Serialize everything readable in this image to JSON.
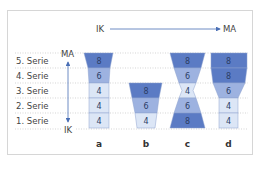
{
  "header": {
    "start_label": "IK",
    "end_label": "MA"
  },
  "axis": {
    "top_label": "MA",
    "bottom_label": "IK"
  },
  "rows": [
    "5. Serie",
    "4. Serie",
    "3. Serie",
    "2. Serie",
    "1. Serie"
  ],
  "columns": [
    {
      "label": "a",
      "values_top_to_bottom": [
        8,
        6,
        4,
        4,
        4
      ]
    },
    {
      "label": "b",
      "values_top_to_bottom": [
        8,
        6,
        4
      ]
    },
    {
      "label": "c",
      "values_top_to_bottom": [
        8,
        6,
        4,
        6,
        8
      ]
    },
    {
      "label": "d",
      "values_top_to_bottom": [
        8,
        8,
        6,
        4,
        4
      ]
    }
  ],
  "colors": {
    "value_8": "#5b7bc4",
    "value_6": "#9db2e0",
    "value_4": "#dce6f6",
    "arrow": "#4a6fb5",
    "gridline": "#bbbbbb",
    "frame": "#d6d6d6"
  },
  "cells": {
    "a": [
      "8",
      "6",
      "4",
      "4",
      "4"
    ],
    "b": [
      "8",
      "6",
      "4"
    ],
    "c": [
      "8",
      "6",
      "4",
      "6",
      "8"
    ],
    "d": [
      "8",
      "8",
      "6",
      "4",
      "4"
    ]
  }
}
